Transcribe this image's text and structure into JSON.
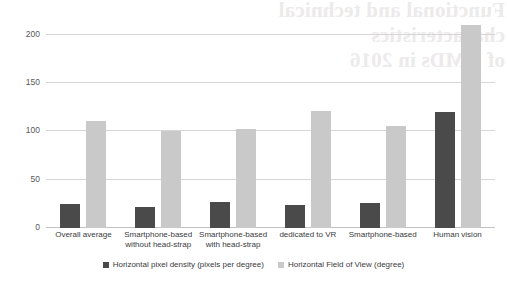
{
  "ghost_text": "Functional and technical characteristics\nof HMDs in 2016",
  "chart_data": {
    "type": "bar",
    "title": "",
    "subtitle": "",
    "xlabel": "",
    "ylabel": "",
    "ylim": [
      0,
      215
    ],
    "yticks": [
      0,
      50,
      100,
      150,
      200
    ],
    "ytick_labels": [
      "0",
      "50",
      "100",
      "150",
      "200"
    ],
    "grid": true,
    "legend_position": "bottom",
    "categories": [
      "Overall average",
      "Smartphone-based\nwithout head-strap",
      "Smartphone-based\nwith head-strap",
      "dedicated to VR",
      "Smartphone-based",
      "Human vision"
    ],
    "series": [
      {
        "name": "Horizontal pixel density (pixels per degree)",
        "color": "#4a4a4a",
        "values": [
          25,
          22,
          27,
          24,
          26,
          120
        ]
      },
      {
        "name": "Horizontal Field of View (degree)",
        "color": "#c9c9c9",
        "values": [
          111,
          100,
          102,
          121,
          105,
          210
        ]
      }
    ]
  }
}
